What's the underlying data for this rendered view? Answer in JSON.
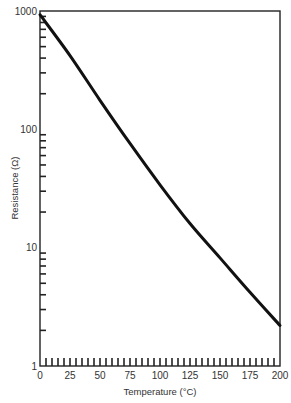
{
  "chart_data": {
    "type": "line",
    "title": "",
    "xlabel": "Temperature (°C)",
    "ylabel": "Resistance (Ω)",
    "xscale": "linear",
    "yscale": "log",
    "xlim": [
      0,
      200
    ],
    "ylim": [
      1,
      1000
    ],
    "x_ticks": [
      0,
      25,
      50,
      75,
      100,
      125,
      150,
      175,
      200
    ],
    "x_tick_labels": [
      "0",
      "25",
      "50",
      "75",
      "100",
      "125",
      "150",
      "175",
      "200"
    ],
    "y_ticks": [
      1,
      10,
      100,
      1000
    ],
    "y_tick_labels": [
      "1",
      "10",
      "100",
      "1000"
    ],
    "grid": false,
    "legend": null,
    "series": [
      {
        "name": "Thermistor resistance",
        "color": "#111111",
        "x": [
          0,
          25,
          50,
          75,
          100,
          125,
          150,
          175,
          200
        ],
        "values": [
          930,
          420,
          176,
          76,
          34,
          16,
          8.2,
          4.2,
          2.2
        ]
      }
    ]
  }
}
